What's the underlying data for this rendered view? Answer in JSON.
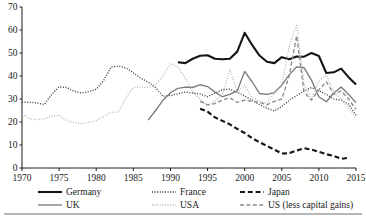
{
  "chart_data": {
    "type": "line",
    "title": "",
    "xlabel": "",
    "ylabel": "",
    "xlim": [
      1970,
      2015
    ],
    "ylim": [
      0,
      70
    ],
    "ytick_labels": [
      "0",
      "10",
      "20",
      "30",
      "40",
      "50",
      "60",
      "70"
    ],
    "yticks": [
      0,
      10,
      20,
      30,
      40,
      50,
      60,
      70
    ],
    "xtick_labels": [
      "1970",
      "1975",
      "1980",
      "1985",
      "1990",
      "1995",
      "2000",
      "2005",
      "2010",
      "2015"
    ],
    "xticks": [
      1970,
      1975,
      1980,
      1985,
      1990,
      1995,
      2000,
      2005,
      2010,
      2015
    ],
    "grid": false,
    "legend_position": "bottom",
    "series": [
      {
        "name": "Germany",
        "style": "solid",
        "color": "#151515",
        "width": 2.1,
        "dash": "",
        "x": [
          1991,
          1992,
          1993,
          1994,
          1995,
          1996,
          1997,
          1998,
          1999,
          2000,
          2001,
          2002,
          2003,
          2004,
          2005,
          2006,
          2007,
          2008,
          2009,
          2010,
          2011,
          2012,
          2013,
          2014,
          2015
        ],
        "values": [
          46.0,
          45.6,
          47.5,
          48.8,
          49.0,
          47.5,
          47.3,
          47.5,
          50.6,
          58.8,
          53.5,
          48.9,
          46.2,
          45.6,
          48.2,
          47.3,
          48.5,
          48.4,
          50.0,
          48.7,
          41.3,
          41.6,
          43.2,
          39.5,
          36.3
        ]
      },
      {
        "name": "France",
        "style": "dotted",
        "color": "#333333",
        "width": 1.35,
        "dash": "1,1.6",
        "x": [
          1970,
          1971,
          1972,
          1973,
          1974,
          1975,
          1976,
          1977,
          1978,
          1979,
          1980,
          1981,
          1982,
          1983,
          1984,
          1985,
          1986,
          1987,
          1988,
          1989,
          1990,
          1991,
          1992,
          1993,
          1994,
          1995,
          1996,
          1997,
          1998,
          1999,
          2000,
          2001,
          2002,
          2003,
          2004,
          2005,
          2006,
          2007,
          2008,
          2009,
          2010,
          2011,
          2012,
          2013,
          2014,
          2015
        ],
        "values": [
          28.6,
          28.6,
          28.3,
          27.6,
          32.0,
          35.3,
          35.0,
          33.4,
          32.6,
          33.2,
          34.2,
          38.0,
          43.9,
          44.3,
          43.5,
          41.4,
          39.0,
          37.4,
          34.9,
          31.2,
          31.5,
          32.3,
          33.0,
          32.6,
          32.2,
          31.0,
          32.5,
          34.0,
          34.3,
          32.9,
          31.3,
          29.6,
          27.5,
          26.0,
          24.8,
          26.8,
          29.4,
          31.5,
          33.5,
          35.0,
          33.5,
          32.0,
          30.0,
          29.5,
          27.8,
          23.0
        ]
      },
      {
        "name": "Japan",
        "style": "dashed",
        "color": "#151515",
        "width": 2.1,
        "dash": "5,2.8",
        "x": [
          1994,
          1995,
          1996,
          1997,
          1998,
          1999,
          2000,
          2001,
          2002,
          2003,
          2004,
          2005,
          2006,
          2007,
          2008,
          2009,
          2010,
          2011,
          2012,
          2013,
          2014
        ],
        "values": [
          25.8,
          24.5,
          22.0,
          20.5,
          19.0,
          17.0,
          15.2,
          13.0,
          11.2,
          9.6,
          8.0,
          6.3,
          6.4,
          7.6,
          8.6,
          8.0,
          7.0,
          6.0,
          5.2,
          4.0,
          4.5
        ]
      },
      {
        "name": "UK",
        "style": "solid",
        "color": "#7c7c7c",
        "width": 1.35,
        "dash": "",
        "x": [
          1987,
          1988,
          1989,
          1990,
          1991,
          1992,
          1993,
          1994,
          1995,
          1996,
          1997,
          1998,
          1999,
          2000,
          2001,
          2002,
          2003,
          2004,
          2005,
          2006,
          2007,
          2008,
          2009,
          2010,
          2011,
          2012,
          2013,
          2014,
          2015
        ],
        "values": [
          20.8,
          25.0,
          29.5,
          32.7,
          34.6,
          35.2,
          35.0,
          36.2,
          35.4,
          33.0,
          31.0,
          32.0,
          33.5,
          42.0,
          37.5,
          32.4,
          32.0,
          32.8,
          36.0,
          40.5,
          44.0,
          43.6,
          38.2,
          31.0,
          28.8,
          32.6,
          35.2,
          32.0,
          28.4
        ]
      },
      {
        "name": "USA",
        "style": "dotted",
        "color": "#b0b0b0",
        "width": 1.35,
        "dash": "0.9,1.7",
        "x": [
          1970,
          1971,
          1972,
          1973,
          1974,
          1975,
          1976,
          1977,
          1978,
          1979,
          1980,
          1981,
          1982,
          1983,
          1984,
          1985,
          1986,
          1987,
          1988,
          1989,
          1990,
          1991,
          1992,
          1993,
          1994,
          1995,
          1996,
          1997,
          1998,
          1999,
          2000,
          2001,
          2002,
          2003,
          2004,
          2005,
          2006,
          2007,
          2008,
          2009,
          2010,
          2011,
          2012,
          2013,
          2014,
          2015
        ],
        "values": [
          23.4,
          21.5,
          21.0,
          21.4,
          22.5,
          22.9,
          20.7,
          19.8,
          19.3,
          19.8,
          20.6,
          22.3,
          24.3,
          24.3,
          30.5,
          35.0,
          35.2,
          35.0,
          36.2,
          40.0,
          45.4,
          44.0,
          39.0,
          33.0,
          30.0,
          27.0,
          29.0,
          32.0,
          43.0,
          33.0,
          36.0,
          30.5,
          29.0,
          28.0,
          32.5,
          36.0,
          53.0,
          62.2,
          36.5,
          30.0,
          38.0,
          40.5,
          33.0,
          30.0,
          26.0,
          22.3
        ]
      },
      {
        "name": "US (less capital gains)",
        "style": "dashed",
        "color": "#8c8c8c",
        "width": 1.35,
        "dash": "4,2.4",
        "x": [
          1994,
          1995,
          1996,
          1997,
          1998,
          1999,
          2000,
          2001,
          2002,
          2003,
          2004,
          2005,
          2006,
          2007,
          2008,
          2009,
          2010,
          2011,
          2012,
          2013,
          2014,
          2015
        ],
        "values": [
          29.0,
          27.5,
          28.0,
          29.5,
          30.5,
          28.5,
          29.5,
          29.0,
          28.5,
          27.5,
          29.0,
          30.0,
          40.0,
          57.5,
          33.0,
          29.5,
          34.0,
          37.5,
          32.0,
          33.5,
          30.0,
          25.5
        ]
      }
    ],
    "legend": [
      {
        "label": "Germany",
        "style": "solid",
        "color": "#151515",
        "width": 2.1,
        "dash": ""
      },
      {
        "label": "France",
        "style": "dotted",
        "color": "#333333",
        "width": 1.35,
        "dash": "1,1.6"
      },
      {
        "label": "Japan",
        "style": "dashed",
        "color": "#151515",
        "width": 2.1,
        "dash": "5,2.8"
      },
      {
        "label": "UK",
        "style": "solid",
        "color": "#7c7c7c",
        "width": 1.35,
        "dash": ""
      },
      {
        "label": "USA",
        "style": "dotted",
        "color": "#b0b0b0",
        "width": 1.35,
        "dash": "0.9,1.7"
      },
      {
        "label": "US (less capital gains)",
        "style": "dashed",
        "color": "#8c8c8c",
        "width": 1.35,
        "dash": "4,2.4"
      }
    ]
  },
  "layout": {
    "plot_left": 22,
    "plot_right": 356,
    "plot_top": 7,
    "plot_bottom": 168,
    "legend_rows": [
      [
        {
          "series": 0,
          "sample_x": 38,
          "text_x": 66
        },
        {
          "series": 1,
          "sample_x": 152,
          "text_x": 180
        },
        {
          "series": 2,
          "sample_x": 240,
          "text_x": 268
        }
      ],
      [
        {
          "series": 3,
          "sample_x": 38,
          "text_x": 66
        },
        {
          "series": 4,
          "sample_x": 152,
          "text_x": 180
        },
        {
          "series": 5,
          "sample_x": 240,
          "text_x": 268
        }
      ]
    ],
    "legend_row_y": [
      192,
      205
    ],
    "bottom_rule_y": 214,
    "axis_color": "#1a1a1a",
    "background": "#ffffff"
  }
}
